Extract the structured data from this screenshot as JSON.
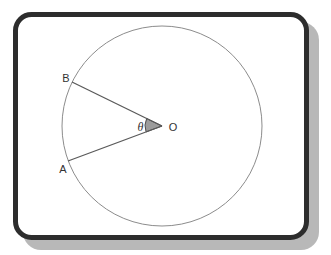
{
  "diagram": {
    "type": "geometry-figure",
    "labels": {
      "point_b": "B",
      "point_a": "A",
      "center": "O",
      "angle": "θ"
    }
  },
  "colors": {
    "page_background": "#ffffff",
    "frame_border": "#2d2d2d",
    "frame_fill": "#ffffff",
    "shadow": "#b8b8b8",
    "circle_stroke": "#8c8c8c",
    "radius_line": "#5a5a5a",
    "wedge_fill": "#9c9c9c",
    "wedge_stroke": "#4d4d4d",
    "label_text": "#333333"
  }
}
